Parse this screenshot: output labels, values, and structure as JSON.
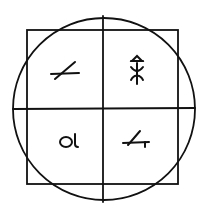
{
  "diagram": {
    "colors": {
      "stroke": "#111111",
      "background": "#ffffff"
    },
    "circle": {
      "cx": 104,
      "cy": 109,
      "r": 91
    },
    "square": {
      "x": 27,
      "y": 30,
      "width": 151,
      "height": 154
    },
    "dividers": {
      "vertical_x": 103,
      "horizontal_y": 109
    },
    "quadrants": [
      {
        "position": "top-left",
        "glyph": "slanted-line-crossing-horizontal"
      },
      {
        "position": "top-right",
        "glyph": "triangle-over-branching-stem"
      },
      {
        "position": "bottom-left",
        "glyph": "ol",
        "text": "Ol"
      },
      {
        "position": "bottom-right",
        "glyph": "slanted-line-on-hooked-base"
      }
    ]
  }
}
